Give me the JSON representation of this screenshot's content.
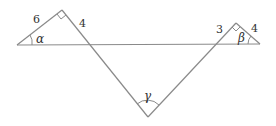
{
  "diagram": {
    "stroke_color": "#8a8a8a",
    "labels": {
      "side_left_hyp_upper": "6",
      "side_left_down": "4",
      "side_right_down": "3",
      "side_right_upper": "4",
      "angle_left": "α",
      "angle_right": "β",
      "angle_bottom": "γ"
    },
    "points": {
      "left_vertex": [
        17,
        45
      ],
      "left_right_angle": [
        62,
        10
      ],
      "bottom_vertex": [
        148,
        117
      ],
      "right_right_angle": [
        236,
        23
      ],
      "right_vertex": [
        260,
        44
      ]
    }
  }
}
